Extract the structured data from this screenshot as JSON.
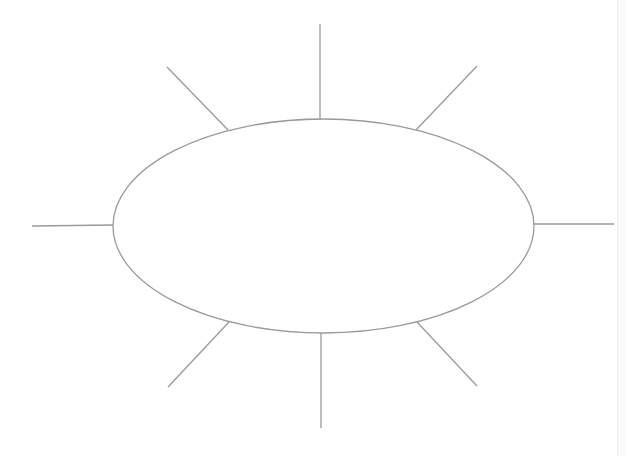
{
  "diagram": {
    "type": "spider-map",
    "hub": {
      "shape": "ellipse",
      "label": ""
    },
    "spokes": [
      {
        "direction": "top",
        "label": ""
      },
      {
        "direction": "top-right",
        "label": ""
      },
      {
        "direction": "right",
        "label": ""
      },
      {
        "direction": "bottom-right",
        "label": ""
      },
      {
        "direction": "bottom",
        "label": ""
      },
      {
        "direction": "bottom-left",
        "label": ""
      },
      {
        "direction": "left",
        "label": ""
      },
      {
        "direction": "top-left",
        "label": ""
      }
    ],
    "line_color": "#9a9a9a",
    "background_color": "#ffffff"
  }
}
